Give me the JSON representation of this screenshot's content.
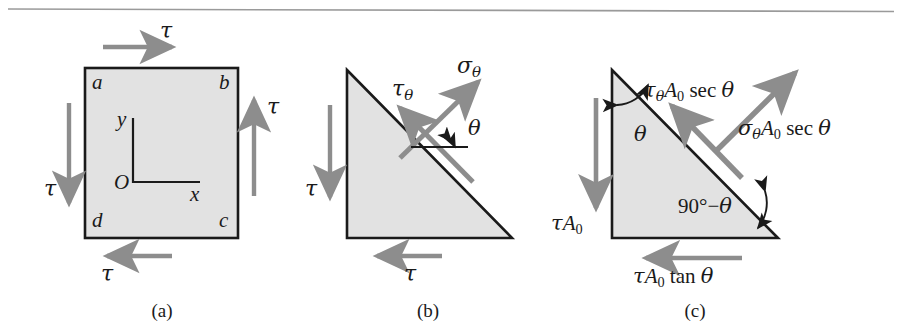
{
  "figure": {
    "rule_color": "#9a9a9a",
    "arrow_color": "#8d8d8d",
    "shape_fill": "#e2e2e2",
    "shape_stroke": "#1a1a1a",
    "text_color": "#1a1a1a",
    "panels": [
      {
        "id": "panel-a",
        "caption": "(a)",
        "shape": "square",
        "corner_labels": [
          "a",
          "b",
          "c",
          "d"
        ],
        "axis": {
          "origin_label": "O",
          "x_label": "x",
          "y_label": "y"
        },
        "arrows": [
          {
            "name": "top-shear-arrow",
            "label": "τ",
            "direction": "right"
          },
          {
            "name": "right-shear-arrow",
            "label": "τ",
            "direction": "up"
          },
          {
            "name": "bottom-shear-arrow",
            "label": "τ",
            "direction": "left"
          },
          {
            "name": "left-shear-arrow",
            "label": "τ",
            "direction": "down"
          }
        ]
      },
      {
        "id": "panel-b",
        "caption": "(b)",
        "shape": "triangle",
        "arrows": [
          {
            "name": "left-shear-arrow",
            "label": "τ",
            "direction": "down"
          },
          {
            "name": "bottom-shear-arrow",
            "label": "τ",
            "direction": "left"
          },
          {
            "name": "inclined-shear-arrow",
            "label_base": "τ",
            "label_sub": "θ",
            "direction": "up-left"
          },
          {
            "name": "normal-stress-arrow",
            "label_base": "σ",
            "label_sub": "θ",
            "direction": "up-right"
          }
        ],
        "angle_label": "θ"
      },
      {
        "id": "panel-c",
        "caption": "(c)",
        "shape": "triangle",
        "arrows": [
          {
            "name": "left-force-arrow",
            "label": "τA₀",
            "direction": "down"
          },
          {
            "name": "bottom-force-arrow",
            "label": "τA₀ tan θ",
            "direction": "left"
          },
          {
            "name": "inclined-shear-force-arrow",
            "label": "τθA₀ sec θ",
            "direction": "up-left"
          },
          {
            "name": "normal-force-arrow",
            "label": "σθA₀ sec θ",
            "direction": "up-right"
          }
        ],
        "angle_labels": [
          "θ",
          "90°−θ"
        ]
      }
    ],
    "labels": {
      "tau": "τ",
      "sigma": "σ",
      "theta": "θ",
      "A": "A",
      "zero": "0",
      "sec": "sec",
      "tan": "tan",
      "ninety_minus": "90°−",
      "corner_a": "a",
      "corner_b": "b",
      "corner_c": "c",
      "corner_d": "d",
      "origin": "O",
      "axis_x": "x",
      "axis_y": "y",
      "caption_a": "(a)",
      "caption_b": "(b)",
      "caption_c": "(c)"
    }
  }
}
